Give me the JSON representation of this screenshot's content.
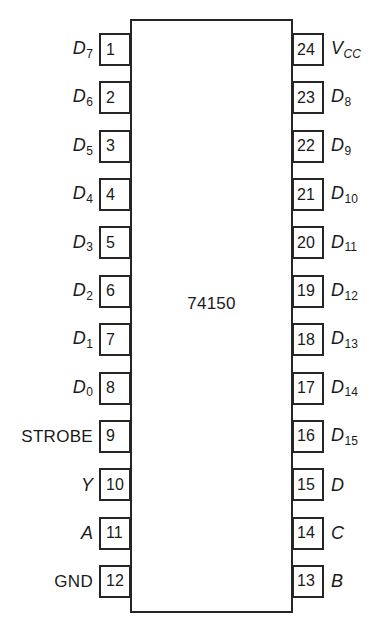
{
  "diagram": {
    "kind": "dip-ic-pinout",
    "part_number": "74150",
    "package_pin_count": 24,
    "line_color": "#262626",
    "background_color": "#ffffff",
    "pins": [
      {
        "number": "1",
        "side": "left",
        "label_base": "D",
        "label_sub": "7",
        "label_style": "italic",
        "label_text": "D7"
      },
      {
        "number": "2",
        "side": "left",
        "label_base": "D",
        "label_sub": "6",
        "label_style": "italic",
        "label_text": "D6"
      },
      {
        "number": "3",
        "side": "left",
        "label_base": "D",
        "label_sub": "5",
        "label_style": "italic",
        "label_text": "D5"
      },
      {
        "number": "4",
        "side": "left",
        "label_base": "D",
        "label_sub": "4",
        "label_style": "italic",
        "label_text": "D4"
      },
      {
        "number": "5",
        "side": "left",
        "label_base": "D",
        "label_sub": "3",
        "label_style": "italic",
        "label_text": "D3"
      },
      {
        "number": "6",
        "side": "left",
        "label_base": "D",
        "label_sub": "2",
        "label_style": "italic",
        "label_text": "D2"
      },
      {
        "number": "7",
        "side": "left",
        "label_base": "D",
        "label_sub": "1",
        "label_style": "italic",
        "label_text": "D1"
      },
      {
        "number": "8",
        "side": "left",
        "label_base": "D",
        "label_sub": "0",
        "label_style": "italic",
        "label_text": "D0"
      },
      {
        "number": "9",
        "side": "left",
        "label_base": "STROBE",
        "label_sub": "",
        "label_style": "plain",
        "label_text": "STROBE"
      },
      {
        "number": "10",
        "side": "left",
        "label_base": "Y",
        "label_sub": "",
        "label_style": "italic",
        "label_text": "Y"
      },
      {
        "number": "11",
        "side": "left",
        "label_base": "A",
        "label_sub": "",
        "label_style": "italic",
        "label_text": "A"
      },
      {
        "number": "12",
        "side": "left",
        "label_base": "GND",
        "label_sub": "",
        "label_style": "plain",
        "label_text": "GND"
      },
      {
        "number": "13",
        "side": "right",
        "label_base": "B",
        "label_sub": "",
        "label_style": "italic",
        "label_text": "B"
      },
      {
        "number": "14",
        "side": "right",
        "label_base": "C",
        "label_sub": "",
        "label_style": "italic",
        "label_text": "C"
      },
      {
        "number": "15",
        "side": "right",
        "label_base": "D",
        "label_sub": "",
        "label_style": "italic",
        "label_text": "D"
      },
      {
        "number": "16",
        "side": "right",
        "label_base": "D",
        "label_sub": "15",
        "label_style": "italic",
        "label_text": "D15"
      },
      {
        "number": "17",
        "side": "right",
        "label_base": "D",
        "label_sub": "14",
        "label_style": "italic",
        "label_text": "D14"
      },
      {
        "number": "18",
        "side": "right",
        "label_base": "D",
        "label_sub": "13",
        "label_style": "italic",
        "label_text": "D13"
      },
      {
        "number": "19",
        "side": "right",
        "label_base": "D",
        "label_sub": "12",
        "label_style": "italic",
        "label_text": "D12"
      },
      {
        "number": "20",
        "side": "right",
        "label_base": "D",
        "label_sub": "11",
        "label_style": "italic",
        "label_text": "D11"
      },
      {
        "number": "21",
        "side": "right",
        "label_base": "D",
        "label_sub": "10",
        "label_style": "italic",
        "label_text": "D10"
      },
      {
        "number": "22",
        "side": "right",
        "label_base": "D",
        "label_sub": "9",
        "label_style": "italic",
        "label_text": "D9"
      },
      {
        "number": "23",
        "side": "right",
        "label_base": "D",
        "label_sub": "8",
        "label_style": "italic",
        "label_text": "D8"
      },
      {
        "number": "24",
        "side": "right",
        "label_base": "V",
        "label_sub": "CC",
        "label_style": "italic-sub-italic",
        "label_text": "VCC"
      }
    ]
  }
}
